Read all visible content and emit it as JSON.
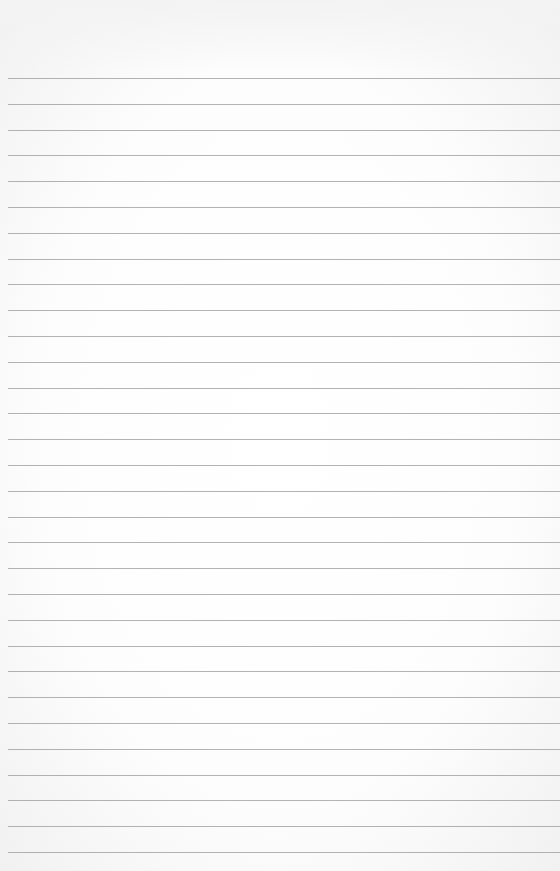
{
  "page": {
    "type": "blank-lined-paper",
    "background_color": "#fbfbfb",
    "rule_color": "#9a9a9a",
    "rules": {
      "count": 31,
      "first_y": 78,
      "spacing": 25.8,
      "left_x": 8
    },
    "text": []
  }
}
